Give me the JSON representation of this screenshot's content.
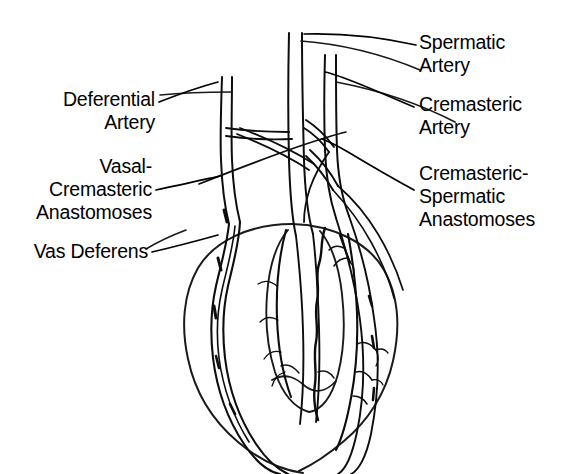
{
  "figure": {
    "background_color": "#ffffff",
    "ink_color": "#000000",
    "width": 563,
    "height": 474
  },
  "labels": {
    "left": [
      {
        "id": "deferential-artery",
        "text": "Deferential\nArtery",
        "align": "right"
      },
      {
        "id": "vasal-cremasteric-anastomoses",
        "text": "Vasal-\nCremasteric\nAnastomoses",
        "align": "right"
      },
      {
        "id": "vas-deferens",
        "text": "Vas Deferens",
        "align": "right"
      }
    ],
    "right": [
      {
        "id": "spermatic-artery",
        "text": "Spermatic\nArtery",
        "align": "left"
      },
      {
        "id": "cremasteric-artery",
        "text": "Cremasteric\nArtery",
        "align": "left"
      },
      {
        "id": "cremasteric-spermatic-anastomoses",
        "text": "Cremasteric-\nSpermatic\nAnastomoses",
        "align": "left"
      }
    ]
  },
  "structures": [
    {
      "id": "spermatic-artery",
      "kind": "artery"
    },
    {
      "id": "cremasteric-artery",
      "kind": "artery"
    },
    {
      "id": "deferential-artery",
      "kind": "artery"
    },
    {
      "id": "vas-deferens",
      "kind": "duct"
    },
    {
      "id": "testis",
      "kind": "organ"
    },
    {
      "id": "epididymis",
      "kind": "organ"
    },
    {
      "id": "vasal-cremasteric-anastomoses",
      "kind": "anastomosis"
    },
    {
      "id": "cremasteric-spermatic-anastomoses",
      "kind": "anastomosis"
    }
  ]
}
